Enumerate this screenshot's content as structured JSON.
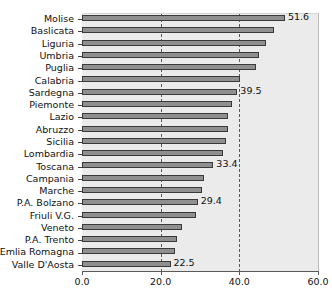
{
  "figure": {
    "title_sliver": "",
    "plot_background": "#ebebeb",
    "bar_fill": "#8f8f8f",
    "bar_border": "#3a3a3a",
    "gridline_color": "#5b5b5b",
    "axis_color": "#5a5a5a"
  },
  "chart_data": {
    "type": "bar",
    "orientation": "horizontal",
    "title": "",
    "xlabel": "",
    "ylabel": "",
    "xlim": [
      0.0,
      60.0
    ],
    "xticks": [
      "0.0",
      "20.0",
      "40.0",
      "60.0"
    ],
    "xtick_values": [
      0.0,
      20.0,
      40.0,
      60.0
    ],
    "gridlines": [
      20.0,
      40.0
    ],
    "grid": true,
    "legend": null,
    "categories": [
      "Molise",
      "Baslicata",
      "Liguria",
      "Umbria",
      "Puglia",
      "Calabria",
      "Sardegna",
      "Piemonte",
      "Lazio",
      "Abruzzo",
      "Sicilia",
      "Lombardia",
      "Toscana",
      "Campania",
      "Marche",
      "P.A. Bolzano",
      "Friuli V.G.",
      "Veneto",
      "P.A. Trento",
      "Emlia Romagna",
      "Valle D'Aosta"
    ],
    "values": [
      51.6,
      48.8,
      46.7,
      44.9,
      44.2,
      40.2,
      39.5,
      38.2,
      37.0,
      37.0,
      36.5,
      35.9,
      33.4,
      31.0,
      30.6,
      29.4,
      28.9,
      25.5,
      24.2,
      23.7,
      22.5
    ],
    "data_labels": [
      "51.6",
      "",
      "",
      "",
      "",
      "",
      "39.5",
      "",
      "",
      "",
      "",
      "",
      "33.4",
      "",
      "",
      "29.4",
      "",
      "",
      "",
      "",
      "22.5"
    ]
  }
}
